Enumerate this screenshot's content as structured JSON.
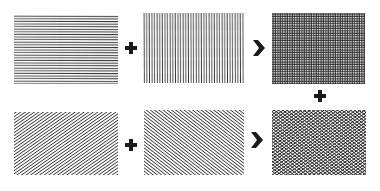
{
  "diagram": {
    "colors": {
      "background": "#ffffff",
      "ink": "#1a1a1a",
      "line": "#3a3a3a"
    },
    "rows": [
      {
        "panels": [
          {
            "id": "horizontal-hatching",
            "pattern": "horizontal"
          },
          {
            "id": "vertical-hatching",
            "pattern": "vertical"
          },
          {
            "id": "crosshatch-orthogonal",
            "pattern": "grid"
          }
        ],
        "operators": [
          "plus",
          "chevron-right"
        ]
      },
      {
        "panels": [
          {
            "id": "diagonal-hatching-rising",
            "pattern": "diagonal-up"
          },
          {
            "id": "diagonal-hatching-falling",
            "pattern": "diagonal-down"
          },
          {
            "id": "crosshatch-diagonal",
            "pattern": "diagonal-grid"
          }
        ],
        "operators": [
          "plus",
          "chevron-right"
        ]
      }
    ],
    "connector": {
      "between": [
        "crosshatch-orthogonal",
        "crosshatch-diagonal"
      ],
      "symbol": "plus"
    }
  }
}
